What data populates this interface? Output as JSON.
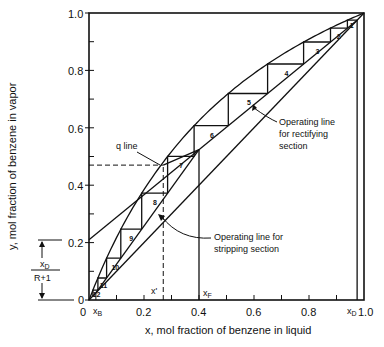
{
  "chart_data": {
    "type": "line",
    "xlabel": "x, mol fraction of benzene in liquid",
    "ylabel": "y, mol fraction of benzene in vapor",
    "xlim": [
      0,
      1.0
    ],
    "ylim": [
      0,
      1.0
    ],
    "x_ticks": [
      "0",
      "0.2",
      "0.4",
      "0.6",
      "0.8",
      "1.0"
    ],
    "y_ticks": [
      "0",
      "0.2",
      "0.4",
      "0.6",
      "0.8",
      "1.0"
    ],
    "x_tick_values": [
      0,
      0.2,
      0.4,
      0.6,
      0.8,
      1.0
    ],
    "y_tick_values": [
      0,
      0.2,
      0.4,
      0.6,
      0.8,
      1.0
    ],
    "minor_ticks": [
      0.1,
      0.3,
      0.5,
      0.7,
      0.9
    ],
    "grid": false,
    "relative_volatility": 2.5,
    "x_D": 0.975,
    "x_B": 0.025,
    "x_F": 0.4,
    "x_prime": 0.27,
    "y_prime": 0.47,
    "rectifying_intercept": 0.21,
    "series": [
      {
        "name": "Equilibrium curve",
        "kind": "curve"
      },
      {
        "name": "Diagonal y = x",
        "x": [
          0,
          1.0
        ],
        "y": [
          0,
          1.0
        ]
      },
      {
        "name": "Operating line for rectifying section",
        "x": [
          0,
          0.975
        ],
        "y": [
          0.21,
          0.975
        ]
      },
      {
        "name": "Operating line for stripping section",
        "x": [
          0.025,
          0.4
        ],
        "y": [
          0.025,
          0.4
        ]
      },
      {
        "name": "q line",
        "x": [
          0.4,
          0.27
        ],
        "y": [
          0.4,
          0.47
        ]
      }
    ],
    "stages": [
      {
        "n": 1,
        "x": 0.94,
        "y": 0.975
      },
      {
        "n": 2,
        "x": 0.89,
        "y": 0.955
      },
      {
        "n": 3,
        "x": 0.8,
        "y": 0.91
      },
      {
        "n": 4,
        "x": 0.66,
        "y": 0.83
      },
      {
        "n": 5,
        "x": 0.48,
        "y": 0.71
      },
      {
        "n": 6,
        "x": 0.35,
        "y": 0.57
      },
      {
        "n": 7,
        "x": 0.275,
        "y": 0.485
      },
      {
        "n": 8,
        "x": 0.23,
        "y": 0.43
      },
      {
        "n": 9,
        "x": 0.17,
        "y": 0.34
      },
      {
        "n": 10,
        "x": 0.115,
        "y": 0.245
      },
      {
        "n": 11,
        "x": 0.07,
        "y": 0.16
      },
      {
        "n": 12,
        "x": 0.035,
        "y": 0.085
      }
    ],
    "annotations": [
      "q line",
      "Operating line for rectifying section",
      "Operating line for stripping section",
      "x_D / (R+1)",
      "x_B",
      "x_F",
      "x'",
      "x_D"
    ]
  },
  "labels": {
    "xlabel": "x, mol fraction of benzene in liquid",
    "ylabel": "y, mol fraction of benzene in vapor",
    "q_line": "q line",
    "rect_line_1": "Operating line",
    "rect_line_2": "for rectifying",
    "rect_line_3": "section",
    "strip_line_1": "Operating line for",
    "strip_line_2": "stripping section",
    "xd_num": "x",
    "xd_num_sub": "D",
    "xd_den": "R+1",
    "xb": "x",
    "xb_sub": "B",
    "xf": "x",
    "xf_sub": "F",
    "xprime": "x'",
    "xd": "x",
    "xd_sub": "D",
    "tick_0x": "0",
    "tick_02x": "0.2",
    "tick_04x": "0.4",
    "tick_06x": "0.6",
    "tick_08x": "0.8",
    "tick_10x": "1.0",
    "tick_0y": "0",
    "tick_02y": "0.2",
    "tick_04y": "0.4",
    "tick_06y": "0.6",
    "tick_08y": "0.8",
    "tick_10y": "1.0"
  }
}
